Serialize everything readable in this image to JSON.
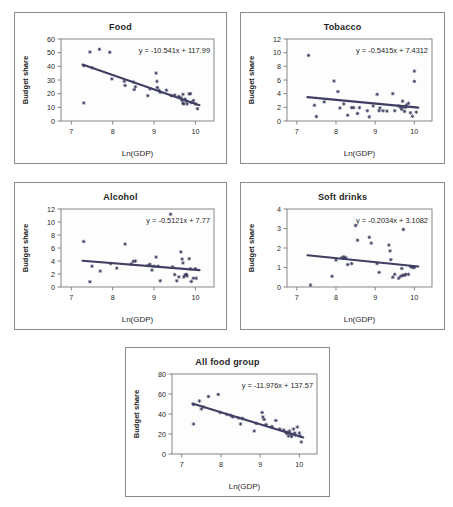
{
  "figure": {
    "name": "budget-share-vs-ln-gdp-panels",
    "background": "#ffffff",
    "panel_border_color": "#8a8a8a",
    "point_color": "#3a3a5c",
    "line_color": "#3f3f63",
    "axis_color": "#7a7a7a"
  },
  "common": {
    "xlabel": "Ln(GDP)",
    "ylabel": "Budget share",
    "xticks": [
      "7",
      "8",
      "9",
      "10"
    ],
    "xlim": [
      6.75,
      10.45
    ]
  },
  "chart_data": [
    {
      "type": "scatter",
      "title": "Food",
      "xlabel": "Ln(GDP)",
      "ylabel": "Budget share",
      "annotation": "y = -10.541x + 117.99",
      "slope": -10.541,
      "intercept": 117.99,
      "xlim": [
        6.75,
        10.45
      ],
      "ylim": [
        0,
        60
      ],
      "yticks": [
        "0",
        "10",
        "20",
        "30",
        "40",
        "50",
        "60"
      ],
      "xticks": [
        "7",
        "8",
        "9",
        "10"
      ],
      "grid": false,
      "trend_x": [
        7.27,
        10.1
      ],
      "points": [
        [
          7.3,
          13.2
        ],
        [
          7.3,
          40.5
        ],
        [
          7.45,
          50.5
        ],
        [
          7.5,
          39.0
        ],
        [
          7.68,
          52.5
        ],
        [
          7.93,
          50.3
        ],
        [
          7.98,
          30.8
        ],
        [
          8.28,
          29.0
        ],
        [
          8.3,
          26.0
        ],
        [
          8.5,
          28.5
        ],
        [
          8.52,
          23.0
        ],
        [
          8.55,
          25.0
        ],
        [
          8.85,
          18.5
        ],
        [
          8.9,
          23.5
        ],
        [
          9.05,
          35.0
        ],
        [
          9.07,
          29.0
        ],
        [
          9.08,
          24.5
        ],
        [
          9.12,
          22.5
        ],
        [
          9.15,
          21.0
        ],
        [
          9.3,
          22.5
        ],
        [
          9.42,
          18.5
        ],
        [
          9.5,
          19.0
        ],
        [
          9.6,
          18.0
        ],
        [
          9.65,
          17.0
        ],
        [
          9.68,
          15.0
        ],
        [
          9.7,
          13.0
        ],
        [
          9.7,
          19.5
        ],
        [
          9.72,
          12.5
        ],
        [
          9.75,
          16.0
        ],
        [
          9.78,
          14.5
        ],
        [
          9.8,
          12.5
        ],
        [
          9.85,
          19.8
        ],
        [
          9.88,
          20.0
        ],
        [
          9.9,
          13.5
        ],
        [
          9.95,
          15.0
        ],
        [
          10.0,
          12.5
        ],
        [
          10.05,
          9.0
        ]
      ]
    },
    {
      "type": "scatter",
      "title": "Tobacco",
      "xlabel": "Ln(GDP)",
      "ylabel": "Budget share",
      "annotation": "y = -0.5415x + 7.4312",
      "slope": -0.5415,
      "intercept": 7.4312,
      "xlim": [
        6.75,
        10.45
      ],
      "ylim": [
        0,
        12
      ],
      "yticks": [
        "0",
        "2",
        "4",
        "6",
        "8",
        "10",
        "12"
      ],
      "xticks": [
        "7",
        "8",
        "9",
        "10"
      ],
      "grid": false,
      "trend_x": [
        7.27,
        10.1
      ],
      "points": [
        [
          7.3,
          9.6
        ],
        [
          7.45,
          2.3
        ],
        [
          7.5,
          0.65
        ],
        [
          7.7,
          2.8
        ],
        [
          7.95,
          5.85
        ],
        [
          8.05,
          4.3
        ],
        [
          8.1,
          1.9
        ],
        [
          8.2,
          2.5
        ],
        [
          8.3,
          0.85
        ],
        [
          8.4,
          1.95
        ],
        [
          8.45,
          1.95
        ],
        [
          8.55,
          1.1
        ],
        [
          8.6,
          1.95
        ],
        [
          8.8,
          1.5
        ],
        [
          8.85,
          0.6
        ],
        [
          8.95,
          2.2
        ],
        [
          9.05,
          3.9
        ],
        [
          9.1,
          1.5
        ],
        [
          9.12,
          1.9
        ],
        [
          9.2,
          1.5
        ],
        [
          9.3,
          1.45
        ],
        [
          9.45,
          4.0
        ],
        [
          9.5,
          1.5
        ],
        [
          9.6,
          2.2
        ],
        [
          9.65,
          2.0
        ],
        [
          9.68,
          1.7
        ],
        [
          9.7,
          2.9
        ],
        [
          9.72,
          2.1
        ],
        [
          9.75,
          1.4
        ],
        [
          9.78,
          2.0
        ],
        [
          9.8,
          2.35
        ],
        [
          9.85,
          2.6
        ],
        [
          9.9,
          1.2
        ],
        [
          9.95,
          0.7
        ],
        [
          10.0,
          7.3
        ],
        [
          10.0,
          5.8
        ],
        [
          10.05,
          1.3
        ]
      ]
    },
    {
      "type": "scatter",
      "title": "Alcohol",
      "xlabel": "Ln(GDP)",
      "ylabel": "Budget share",
      "annotation": "y = -0.5121x + 7.77",
      "slope": -0.5121,
      "intercept": 7.77,
      "xlim": [
        6.75,
        10.45
      ],
      "ylim": [
        0,
        12
      ],
      "yticks": [
        "0",
        "2",
        "4",
        "6",
        "8",
        "10",
        "12"
      ],
      "xticks": [
        "7",
        "8",
        "9",
        "10"
      ],
      "grid": false,
      "trend_x": [
        7.27,
        10.1
      ],
      "points": [
        [
          7.3,
          7.0
        ],
        [
          7.45,
          0.8
        ],
        [
          7.5,
          3.2
        ],
        [
          7.7,
          2.45
        ],
        [
          7.95,
          3.6
        ],
        [
          8.1,
          2.9
        ],
        [
          8.3,
          6.6
        ],
        [
          8.45,
          3.55
        ],
        [
          8.5,
          3.95
        ],
        [
          8.55,
          4.0
        ],
        [
          8.85,
          3.3
        ],
        [
          8.9,
          3.5
        ],
        [
          8.95,
          2.6
        ],
        [
          9.0,
          3.2
        ],
        [
          9.05,
          4.6
        ],
        [
          9.1,
          3.2
        ],
        [
          9.15,
          0.95
        ],
        [
          9.4,
          11.2
        ],
        [
          9.45,
          3.1
        ],
        [
          9.5,
          1.9
        ],
        [
          9.55,
          0.95
        ],
        [
          9.6,
          1.55
        ],
        [
          9.65,
          5.4
        ],
        [
          9.68,
          4.3
        ],
        [
          9.7,
          3.7
        ],
        [
          9.72,
          1.55
        ],
        [
          9.75,
          1.85
        ],
        [
          9.78,
          1.95
        ],
        [
          9.8,
          1.7
        ],
        [
          9.85,
          4.35
        ],
        [
          9.88,
          2.8
        ],
        [
          9.9,
          0.85
        ],
        [
          9.95,
          1.35
        ],
        [
          10.0,
          2.8
        ],
        [
          10.02,
          1.35
        ]
      ]
    },
    {
      "type": "scatter",
      "title": "Soft drinks",
      "xlabel": "Ln(GDP)",
      "ylabel": "Budget share",
      "annotation": "y = -0.2034x + 3.1082",
      "slope": -0.2034,
      "intercept": 3.1082,
      "xlim": [
        6.75,
        10.45
      ],
      "ylim": [
        0,
        4
      ],
      "yticks": [
        "0",
        "1",
        "2",
        "3",
        "4"
      ],
      "xticks": [
        "7",
        "8",
        "9",
        "10"
      ],
      "grid": false,
      "trend_x": [
        7.27,
        10.1
      ],
      "points": [
        [
          7.35,
          0.1
        ],
        [
          7.9,
          0.55
        ],
        [
          8.0,
          1.38
        ],
        [
          8.15,
          1.5
        ],
        [
          8.2,
          1.55
        ],
        [
          8.25,
          1.5
        ],
        [
          8.3,
          1.15
        ],
        [
          8.4,
          1.2
        ],
        [
          8.5,
          3.15
        ],
        [
          8.55,
          2.4
        ],
        [
          8.85,
          2.55
        ],
        [
          8.9,
          2.25
        ],
        [
          9.05,
          1.2
        ],
        [
          9.1,
          0.75
        ],
        [
          9.35,
          2.15
        ],
        [
          9.38,
          1.85
        ],
        [
          9.4,
          1.4
        ],
        [
          9.45,
          0.5
        ],
        [
          9.5,
          0.65
        ],
        [
          9.6,
          0.45
        ],
        [
          9.65,
          0.55
        ],
        [
          9.68,
          0.95
        ],
        [
          9.7,
          0.6
        ],
        [
          9.72,
          2.95
        ],
        [
          9.75,
          0.6
        ],
        [
          9.78,
          0.65
        ],
        [
          9.85,
          0.65
        ],
        [
          9.9,
          1.05
        ],
        [
          9.95,
          1.0
        ],
        [
          10.0,
          1.0
        ]
      ]
    },
    {
      "type": "scatter",
      "title": "All food group",
      "xlabel": "Ln(GDP)",
      "ylabel": "Budget share",
      "annotation": "y = -11.976x + 137.57",
      "slope": -11.976,
      "intercept": 137.57,
      "xlim": [
        6.75,
        10.45
      ],
      "ylim": [
        0,
        80
      ],
      "yticks": [
        "0",
        "20",
        "40",
        "60",
        "80"
      ],
      "xticks": [
        "7",
        "8",
        "9",
        "10"
      ],
      "grid": false,
      "trend_x": [
        7.27,
        10.1
      ],
      "points": [
        [
          7.3,
          30.0
        ],
        [
          7.3,
          49.5
        ],
        [
          7.45,
          53.0
        ],
        [
          7.5,
          45.0
        ],
        [
          7.55,
          47.0
        ],
        [
          7.68,
          57.5
        ],
        [
          7.93,
          59.5
        ],
        [
          7.98,
          41.5
        ],
        [
          8.15,
          39.5
        ],
        [
          8.25,
          38.5
        ],
        [
          8.3,
          37.0
        ],
        [
          8.45,
          36.0
        ],
        [
          8.5,
          30.0
        ],
        [
          8.55,
          35.5
        ],
        [
          8.85,
          23.0
        ],
        [
          8.9,
          30.5
        ],
        [
          9.05,
          41.5
        ],
        [
          9.07,
          37.0
        ],
        [
          9.1,
          34.5
        ],
        [
          9.15,
          29.5
        ],
        [
          9.3,
          27.5
        ],
        [
          9.4,
          33.5
        ],
        [
          9.5,
          25.0
        ],
        [
          9.6,
          24.0
        ],
        [
          9.65,
          22.0
        ],
        [
          9.68,
          20.5
        ],
        [
          9.7,
          21.5
        ],
        [
          9.72,
          18.0
        ],
        [
          9.75,
          23.0
        ],
        [
          9.78,
          20.0
        ],
        [
          9.8,
          17.5
        ],
        [
          9.85,
          25.0
        ],
        [
          9.88,
          21.0
        ],
        [
          9.9,
          19.0
        ],
        [
          9.95,
          27.0
        ],
        [
          10.0,
          21.0
        ],
        [
          10.02,
          18.0
        ],
        [
          10.05,
          12.0
        ]
      ]
    }
  ],
  "layout": {
    "panels": [
      {
        "key": 0,
        "x": 14,
        "y": 12,
        "w": 213,
        "h": 152
      },
      {
        "key": 1,
        "x": 240,
        "y": 12,
        "w": 205,
        "h": 152
      },
      {
        "key": 2,
        "x": 14,
        "y": 182,
        "w": 213,
        "h": 148
      },
      {
        "key": 3,
        "x": 240,
        "y": 182,
        "w": 205,
        "h": 148
      },
      {
        "key": 4,
        "x": 125,
        "y": 347,
        "w": 205,
        "h": 150
      }
    ]
  }
}
